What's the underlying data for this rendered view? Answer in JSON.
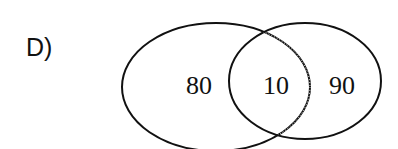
{
  "option_label": "D)",
  "venn": {
    "left_only": "80",
    "intersection": "10",
    "right_only": "90"
  },
  "colors": {
    "stroke": "#111111",
    "background": "#ffffff"
  }
}
